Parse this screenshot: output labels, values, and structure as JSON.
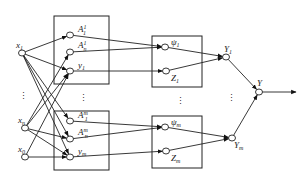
{
  "diagram": {
    "inputs": [
      {
        "id": "x1",
        "label": "x",
        "sub": "1"
      },
      {
        "id": "xn",
        "label": "x",
        "sub": "n"
      },
      {
        "id": "x0",
        "label": "x",
        "sub": "0"
      }
    ],
    "left_top_box": [
      {
        "id": "A11",
        "label": "A",
        "sub": "1",
        "sup": "1"
      },
      {
        "id": "An1",
        "label": "A",
        "sub": "n",
        "sup": "1"
      },
      {
        "id": "y1",
        "label": "y",
        "sub": "1"
      }
    ],
    "left_bottom_box": [
      {
        "id": "A1m",
        "label": "A",
        "sub": "1",
        "sup": "m"
      },
      {
        "id": "Anm",
        "label": "A",
        "sub": "n",
        "sup": "m"
      },
      {
        "id": "ym",
        "label": "y",
        "sub": "m"
      }
    ],
    "right_top_box": [
      {
        "id": "psi1",
        "label": "ψ",
        "sub": "1"
      },
      {
        "id": "Z1",
        "label": "Z",
        "sub": "1"
      }
    ],
    "right_bottom_box": [
      {
        "id": "psim",
        "label": "ψ",
        "sub": "m"
      },
      {
        "id": "Zm",
        "label": "Z",
        "sub": "m"
      }
    ],
    "aggregators": [
      {
        "id": "Y1",
        "label": "Y",
        "sub": "1"
      },
      {
        "id": "Ym",
        "label": "Y",
        "sub": "m"
      }
    ],
    "output": {
      "id": "Y",
      "label": "Y"
    },
    "ellipsis": "⋮"
  }
}
